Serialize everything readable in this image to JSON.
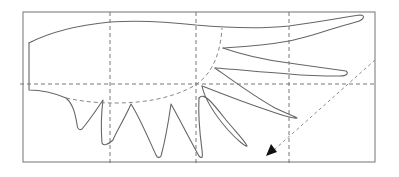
{
  "diagram": {
    "type": "paper-template",
    "frame": {
      "x": 23,
      "y": 12,
      "width": 352,
      "height": 150
    },
    "grid": {
      "vertical_lines_x": [
        110,
        196,
        289
      ],
      "horizontal_lines_y": [
        84
      ],
      "style": "dashed"
    },
    "parts": {
      "wing_body": "solid outline",
      "upper_feathers": 3,
      "lower_spikes": 5,
      "fold_line": "dashed arc"
    },
    "arrow": {
      "style": "dashed",
      "from": [
        375,
        60
      ],
      "to": [
        266,
        155
      ],
      "direction": "down-left"
    },
    "colors": {
      "outline": "#666666",
      "grid": "#6a6a6a",
      "arrowhead": "#111111",
      "background": "#ffffff"
    }
  }
}
